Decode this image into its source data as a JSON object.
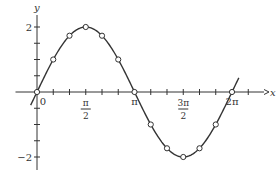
{
  "chart_data": {
    "type": "line",
    "title": "",
    "function": "y = 2 sin x",
    "xlabel": "x",
    "ylabel": "y",
    "xlim": [
      -0.2,
      2.35
    ],
    "xlim_units": "multiples of pi",
    "ylim": [
      -2.2,
      2.2
    ],
    "grid": false,
    "legend": "none",
    "x_tick_labels": [
      {
        "value_pi": 0,
        "label": "0"
      },
      {
        "value_pi": 0.5,
        "numerator": "π",
        "denominator": "2"
      },
      {
        "value_pi": 1,
        "label": "π"
      },
      {
        "value_pi": 1.5,
        "numerator": "3π",
        "denominator": "2"
      },
      {
        "value_pi": 2,
        "label": "2π"
      }
    ],
    "x_minor_ticks_pi": [
      0.1667,
      0.3333,
      0.5,
      0.6667,
      0.8333,
      1,
      1.1667,
      1.3333,
      1.5,
      1.6667,
      1.8333,
      2,
      2.1667
    ],
    "y_tick_labels": [
      {
        "value": 2,
        "label": "2"
      },
      {
        "value": -2,
        "label": "−2"
      }
    ],
    "y_minor_ticks": [
      -2,
      -1.5,
      -1,
      -0.5,
      0.5,
      1,
      1.5,
      2
    ],
    "series": [
      {
        "name": "2 sin x",
        "marker": "open-circle",
        "points": [
          {
            "x_pi": 0,
            "y": 0
          },
          {
            "x_pi": 0.1667,
            "y": 1
          },
          {
            "x_pi": 0.3333,
            "y": 1.732
          },
          {
            "x_pi": 0.5,
            "y": 2
          },
          {
            "x_pi": 0.6667,
            "y": 1.732
          },
          {
            "x_pi": 0.8333,
            "y": 1
          },
          {
            "x_pi": 1,
            "y": 0
          },
          {
            "x_pi": 1.1667,
            "y": -1
          },
          {
            "x_pi": 1.3333,
            "y": -1.732
          },
          {
            "x_pi": 1.5,
            "y": -2
          },
          {
            "x_pi": 1.6667,
            "y": -1.732
          },
          {
            "x_pi": 1.8333,
            "y": -1
          },
          {
            "x_pi": 2,
            "y": 0
          }
        ]
      }
    ]
  }
}
